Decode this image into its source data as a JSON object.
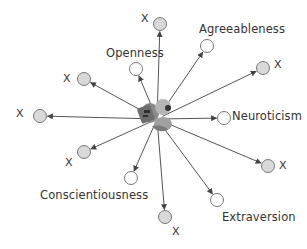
{
  "diagram": {
    "center": {
      "x": 157,
      "y": 119,
      "icon": "person-figure-icon"
    },
    "nodes": [
      {
        "id": "x-top",
        "label": "X",
        "kind": "unnamed",
        "cx": 160,
        "cy": 24,
        "lx": 141,
        "ly": 13
      },
      {
        "id": "agreeableness",
        "label": "Agreeableness",
        "kind": "trait",
        "cx": 207,
        "cy": 46,
        "lx": 199,
        "ly": 24
      },
      {
        "id": "openness",
        "label": "Openness",
        "kind": "trait",
        "cx": 136,
        "cy": 69,
        "lx": 106,
        "ly": 48
      },
      {
        "id": "x-upper-left",
        "label": "X",
        "kind": "unnamed",
        "cx": 84,
        "cy": 79,
        "lx": 63,
        "ly": 73
      },
      {
        "id": "x-upper-right",
        "label": "X",
        "kind": "unnamed",
        "cx": 263,
        "cy": 68,
        "lx": 274,
        "ly": 59
      },
      {
        "id": "x-left",
        "label": "X",
        "kind": "unnamed",
        "cx": 40,
        "cy": 116,
        "lx": 16,
        "ly": 108
      },
      {
        "id": "neuroticism",
        "label": "Neuroticism",
        "kind": "trait",
        "cx": 224,
        "cy": 118,
        "lx": 232,
        "ly": 111
      },
      {
        "id": "x-lower-left",
        "label": "X",
        "kind": "unnamed",
        "cx": 84,
        "cy": 152,
        "lx": 65,
        "ly": 157
      },
      {
        "id": "conscientiousness",
        "label": "Conscientiousness",
        "kind": "trait",
        "cx": 131,
        "cy": 178,
        "lx": 40,
        "ly": 190
      },
      {
        "id": "x-lower-right",
        "label": "X",
        "kind": "unnamed",
        "cx": 268,
        "cy": 166,
        "lx": 279,
        "ly": 160
      },
      {
        "id": "extraversion",
        "label": "Extraversion",
        "kind": "trait",
        "cx": 217,
        "cy": 200,
        "lx": 222,
        "ly": 212
      },
      {
        "id": "x-bottom",
        "label": "X",
        "kind": "unnamed",
        "cx": 165,
        "cy": 217,
        "lx": 172,
        "ly": 226
      }
    ],
    "colors": {
      "line": "#555555",
      "trait_fill": "#ffffff",
      "unnamed_fill": "#d9d9d9",
      "stroke": "#777777",
      "text": "#333333"
    }
  }
}
